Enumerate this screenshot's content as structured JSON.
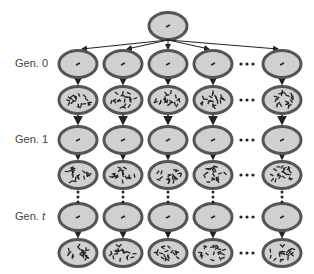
{
  "labels": {
    "gen0": "Gen. 0",
    "gen1": "Gen. 1",
    "gent_prefix": "Gen. ",
    "gent_var": "t"
  },
  "layout": {
    "columns": [
      78,
      123,
      168,
      213,
      282
    ],
    "ellipsis_x": 247,
    "rows": [
      {
        "y": 64,
        "type": "sparse"
      },
      {
        "y": 100,
        "type": "dense"
      },
      {
        "y": 140,
        "type": "sparse"
      },
      {
        "y": 175,
        "type": "dense"
      },
      {
        "y": 217,
        "type": "sparse"
      },
      {
        "y": 253,
        "type": "dense"
      }
    ],
    "root": {
      "x": 168,
      "y": 26
    }
  },
  "colors": {
    "fill": "#d0d0d0",
    "stroke": "#555555",
    "text": "#444444"
  }
}
